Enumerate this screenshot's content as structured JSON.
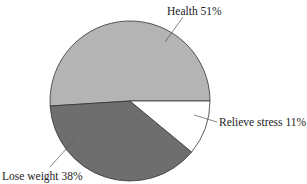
{
  "chart_data": {
    "type": "pie",
    "title": "",
    "slices": [
      {
        "label": "Health",
        "value": 51,
        "display": "Health 51%",
        "color": "#b4b4b4"
      },
      {
        "label": "Relieve stress",
        "value": 11,
        "display": "Relieve stress 11%",
        "color": "#ffffff"
      },
      {
        "label": "Lose weight",
        "value": 38,
        "display": "Lose weight 38%",
        "color": "#6e6e6e"
      }
    ],
    "legend": "none",
    "labels_position": "outside with leader lines",
    "unit": "%"
  }
}
